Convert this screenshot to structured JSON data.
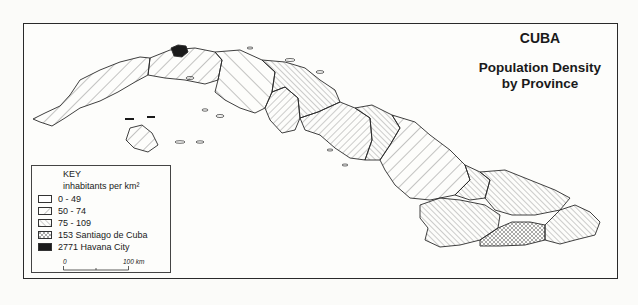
{
  "title": {
    "country": "CUBA",
    "line1": "Population Density",
    "line2": "by Province"
  },
  "key": {
    "heading": "KEY",
    "unit": "inhabitants per km²",
    "entries": [
      {
        "label": "0 - 49",
        "pattern": "blank"
      },
      {
        "label": "50 - 74",
        "pattern": "wide-diagonal"
      },
      {
        "label": "75 - 109",
        "pattern": "dense-diagonal"
      },
      {
        "label": "153 Santiago de Cuba",
        "pattern": "crosshatch"
      },
      {
        "label": "2771 Havana City",
        "pattern": "solid-black"
      }
    ],
    "scale": {
      "start": "0",
      "end": "100 km"
    }
  },
  "colors": {
    "ink": "#2a2a2a",
    "paper": "#fdfdfb",
    "havana": "#1a1a1a"
  }
}
